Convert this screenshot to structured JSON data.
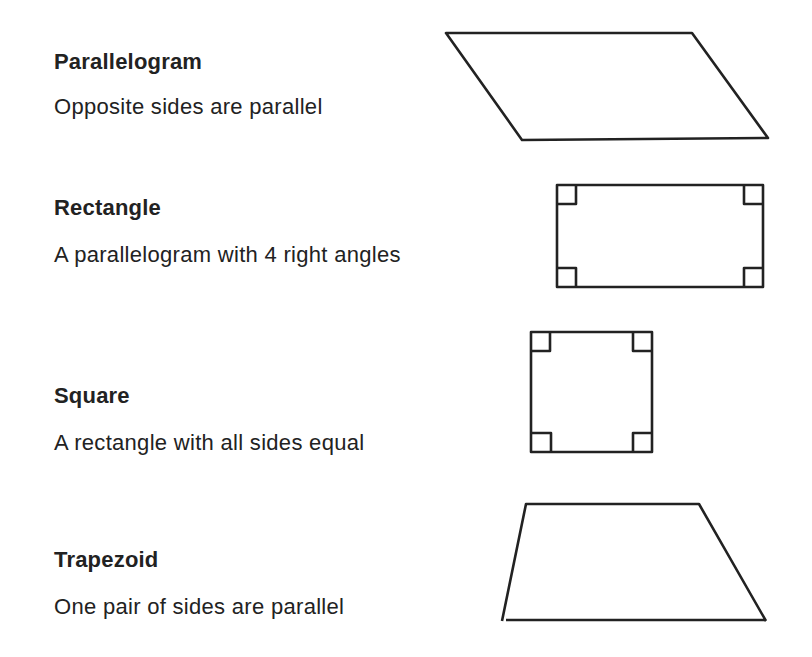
{
  "shapes": [
    {
      "name": "Parallelogram",
      "description": "Opposite sides are parallel"
    },
    {
      "name": "Rectangle",
      "description": "A parallelogram with 4 right angles"
    },
    {
      "name": "Square",
      "description": "A rectangle with all sides equal"
    },
    {
      "name": "Trapezoid",
      "description": "One pair of sides are parallel"
    }
  ],
  "colors": {
    "stroke": "#222222",
    "text": "#222222",
    "background": "#ffffff"
  }
}
